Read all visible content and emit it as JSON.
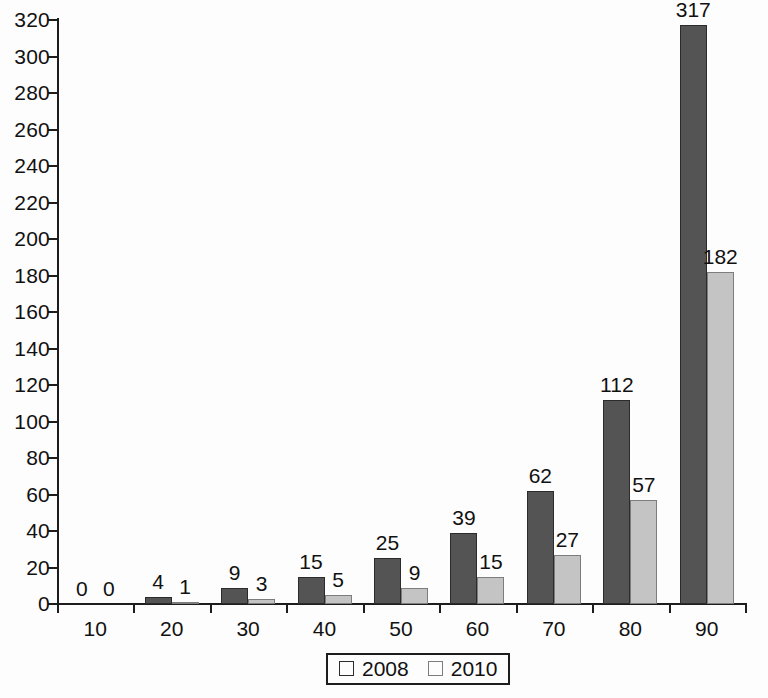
{
  "chart_data": {
    "type": "bar",
    "title": "",
    "subtitle": "",
    "xlabel": "",
    "ylabel": "",
    "categories": [
      "10",
      "20",
      "30",
      "40",
      "50",
      "60",
      "70",
      "80",
      "90"
    ],
    "series": [
      {
        "name": "2008",
        "color": "#545454",
        "values": [
          0,
          4,
          9,
          15,
          25,
          39,
          62,
          112,
          317
        ]
      },
      {
        "name": "2010",
        "color": "#c4c4c4",
        "values": [
          0,
          1,
          3,
          5,
          9,
          15,
          27,
          57,
          182
        ]
      }
    ],
    "ylim": [
      0,
      320
    ],
    "ytick_step": 20,
    "yticks": [
      0,
      20,
      40,
      60,
      80,
      100,
      120,
      140,
      160,
      180,
      200,
      220,
      240,
      260,
      280,
      300,
      320
    ],
    "grid": false,
    "legend_position": "bottom-center",
    "data_labels": true,
    "annotations": []
  },
  "legend": {
    "entries": [
      {
        "label": "2008"
      },
      {
        "label": "2010"
      }
    ]
  },
  "axis": {
    "y_tick_labels": [
      "0",
      "20",
      "40",
      "60",
      "80",
      "100",
      "120",
      "140",
      "160",
      "180",
      "200",
      "220",
      "240",
      "260",
      "280",
      "300",
      "320"
    ],
    "x_tick_labels": [
      "10",
      "20",
      "30",
      "40",
      "50",
      "60",
      "70",
      "80",
      "90"
    ]
  },
  "colors": {
    "series_2008": "#545454",
    "series_2010": "#c4c4c4",
    "axis": "#1d1d1d",
    "background": "#fdfdfd",
    "text": "#111111"
  }
}
